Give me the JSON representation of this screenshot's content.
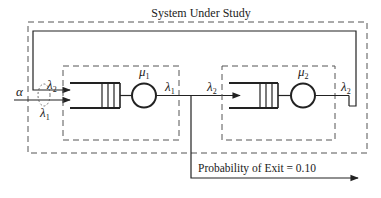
{
  "diagram": {
    "title": "System Under Study",
    "colors": {
      "line": "#222222",
      "dashed": "#555555",
      "background": "#ffffff"
    },
    "external_input": {
      "symbol": "α"
    },
    "merge_labels": {
      "feedback": {
        "symbol": "λ",
        "sub": "2"
      },
      "external": {
        "symbol": "λ",
        "sub": "1"
      }
    },
    "station_1": {
      "service_rate": {
        "symbol": "μ",
        "sub": "1"
      },
      "output_flow": {
        "symbol": "λ",
        "sub": "1"
      }
    },
    "station_2": {
      "input_flow": {
        "symbol": "λ",
        "sub": "2"
      },
      "service_rate": {
        "symbol": "μ",
        "sub": "2"
      },
      "output_flow": {
        "symbol": "λ",
        "sub": "2"
      }
    },
    "exit": {
      "label": "Probability of Exit = 0.10"
    }
  }
}
